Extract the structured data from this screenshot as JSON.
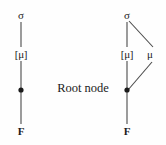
{
  "figure": {
    "caption": "Root node",
    "background_color": "#fefefe",
    "stroke_color": "#4a4a4a",
    "text_color": "#1b1b1b"
  },
  "trees": [
    {
      "id": "left-tree",
      "name": "linear-chain-tree",
      "nodes": [
        {
          "id": "l-sigma",
          "label": "σ",
          "kind": "sigma-label",
          "x": 21,
          "y": 15
        },
        {
          "id": "l-mubr",
          "label": "[μ]",
          "kind": "bracketed-mu-label",
          "x": 21,
          "y": 54
        },
        {
          "id": "l-dot",
          "label": "",
          "kind": "root-dot",
          "x": 21,
          "y": 90
        },
        {
          "id": "l-leaf",
          "label": "F",
          "kind": "leaf-label",
          "x": 21,
          "y": 131
        }
      ],
      "edges": [
        {
          "from": "l-sigma",
          "to": "l-mubr"
        },
        {
          "from": "l-mubr",
          "to": "l-dot"
        },
        {
          "from": "l-dot",
          "to": "l-leaf"
        }
      ]
    },
    {
      "id": "right-tree",
      "name": "branching-tree",
      "nodes": [
        {
          "id": "r-sigma",
          "label": "σ",
          "kind": "sigma-label",
          "x": 127,
          "y": 15
        },
        {
          "id": "r-mubr",
          "label": "[μ]",
          "kind": "bracketed-mu-label",
          "x": 127,
          "y": 54
        },
        {
          "id": "r-mu",
          "label": "μ",
          "kind": "mu-label",
          "x": 150,
          "y": 54
        },
        {
          "id": "r-dot",
          "label": "",
          "kind": "root-dot",
          "x": 127,
          "y": 90
        },
        {
          "id": "r-leaf",
          "label": "F",
          "kind": "leaf-label",
          "x": 127,
          "y": 131
        }
      ],
      "edges": [
        {
          "from": "r-sigma",
          "to": "r-mubr"
        },
        {
          "from": "r-sigma",
          "to": "r-mu"
        },
        {
          "from": "r-mubr",
          "to": "r-dot"
        },
        {
          "from": "r-mu",
          "to": "r-dot"
        },
        {
          "from": "r-dot",
          "to": "r-leaf"
        }
      ]
    }
  ],
  "caption_position": {
    "x": 83,
    "y": 88
  }
}
